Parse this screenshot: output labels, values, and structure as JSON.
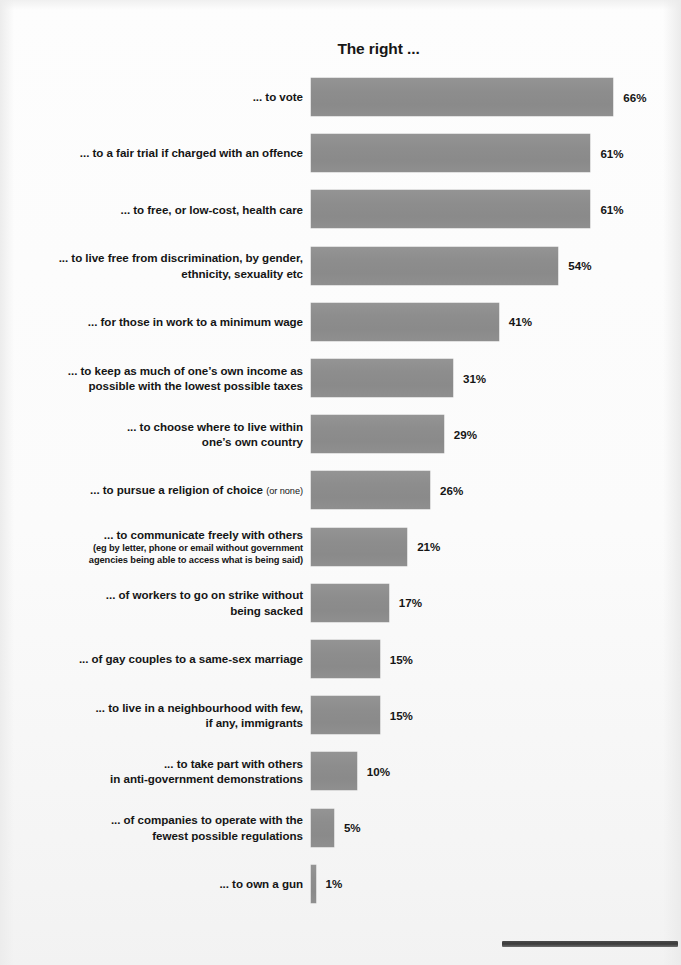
{
  "chart_data": {
    "type": "bar",
    "orientation": "horizontal",
    "title": "The right ...",
    "xlabel": "",
    "ylabel": "",
    "xlim": [
      0,
      70
    ],
    "grid": false,
    "legend": null,
    "value_suffix": "%",
    "bar_color": "#8d8d8d",
    "background_color": "#fbfbfb",
    "text_color": "#151515",
    "categories": [
      "... to vote",
      "... to a fair trial if charged with an offence",
      "... to free, or low-cost, health care",
      "... to live free from discrimination, by gender, ethnicity, sexuality etc",
      "... for those in work to a minimum wage",
      "... to keep as much of one’s own income as possible with the lowest possible taxes",
      "... to choose where to live within one’s own country",
      "... to pursue a religion of choice (or none)",
      "... to communicate freely with others (eg by letter, phone or email without government agencies being able to access what is being said)",
      "... of workers to go on strike without being sacked",
      "... of gay couples to a same-sex marriage",
      "... to live in a neighbourhood with few, if any, immigrants",
      "... to take part with others in anti-government demonstrations",
      "... of companies to operate with the fewest possible regulations",
      "... to own a gun"
    ],
    "values": [
      66,
      61,
      61,
      54,
      41,
      31,
      29,
      26,
      21,
      17,
      15,
      15,
      10,
      5,
      1
    ],
    "value_labels": [
      "66%",
      "61%",
      "61%",
      "54%",
      "41%",
      "31%",
      "29%",
      "26%",
      "21%",
      "17%",
      "15%",
      "15%",
      "10%",
      "5%",
      "1%"
    ]
  },
  "rows": [
    {
      "lines": [
        {
          "text": "... to vote",
          "small": false
        }
      ],
      "value": 66,
      "value_label": "66%"
    },
    {
      "lines": [
        {
          "text": "... to a fair trial if charged with an offence",
          "small": false
        }
      ],
      "value": 61,
      "value_label": "61%"
    },
    {
      "lines": [
        {
          "text": "... to free, or low-cost, health care",
          "small": false
        }
      ],
      "value": 61,
      "value_label": "61%"
    },
    {
      "lines": [
        {
          "text": "... to live free from discrimination, by gender,",
          "small": false
        },
        {
          "text": "ethnicity, sexuality etc",
          "small": false
        }
      ],
      "value": 54,
      "value_label": "54%"
    },
    {
      "lines": [
        {
          "text": "... for those in work to a minimum wage",
          "small": false
        }
      ],
      "value": 41,
      "value_label": "41%"
    },
    {
      "lines": [
        {
          "text": "... to keep as much of one’s own income as",
          "small": false
        },
        {
          "text": "possible with the lowest possible taxes",
          "small": false
        }
      ],
      "value": 31,
      "value_label": "31%"
    },
    {
      "lines": [
        {
          "text": "... to choose where to live within",
          "small": false
        },
        {
          "text": "one’s own country",
          "small": false
        }
      ],
      "value": 29,
      "value_label": "29%"
    },
    {
      "lines": [
        {
          "text": "... to pursue a religion of choice ",
          "small": false,
          "trailing_small": "(or none)"
        }
      ],
      "value": 26,
      "value_label": "26%"
    },
    {
      "lines": [
        {
          "text": "... to communicate freely with others",
          "small": false
        },
        {
          "text": "(eg by letter, phone or email without government",
          "small": true
        },
        {
          "text": "agencies being able to access what is being said)",
          "small": true
        }
      ],
      "value": 21,
      "value_label": "21%"
    },
    {
      "lines": [
        {
          "text": "... of workers to go on strike without",
          "small": false
        },
        {
          "text": "being sacked",
          "small": false
        }
      ],
      "value": 17,
      "value_label": "17%"
    },
    {
      "lines": [
        {
          "text": "... of gay couples to a same-sex marriage",
          "small": false
        }
      ],
      "value": 15,
      "value_label": "15%"
    },
    {
      "lines": [
        {
          "text": "... to live in a neighbourhood with few,",
          "small": false
        },
        {
          "text": "if any, immigrants",
          "small": false
        }
      ],
      "value": 15,
      "value_label": "15%"
    },
    {
      "lines": [
        {
          "text": "... to take part with others",
          "small": false
        },
        {
          "text": "in anti-government demonstrations",
          "small": false
        }
      ],
      "value": 10,
      "value_label": "10%"
    },
    {
      "lines": [
        {
          "text": "... of companies to operate with the",
          "small": false
        },
        {
          "text": "fewest possible regulations",
          "small": false
        }
      ],
      "value": 5,
      "value_label": "5%"
    },
    {
      "lines": [
        {
          "text": "... to own a gun",
          "small": false
        }
      ],
      "value": 1,
      "value_label": "1%"
    }
  ],
  "geometry": {
    "bar_left_px": 311,
    "px_per_unit": 4.58,
    "first_bar_top_px": 78,
    "row_pitch_px": 56.2,
    "bar_height_px": 38
  }
}
